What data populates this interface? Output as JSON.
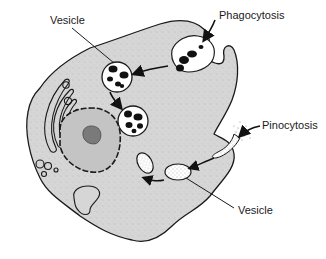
{
  "diagram": {
    "labels": {
      "vesicle_top": "Vesicle",
      "phagocytosis": "Phagocytosis",
      "pinocytosis": "Pinocytosis",
      "vesicle_bottom": "Vesicle"
    },
    "structures": [
      "cell-membrane",
      "cytoplasm",
      "nucleus",
      "nucleolus",
      "golgi-apparatus",
      "phagocytic-vesicles",
      "pinocytic-vesicles",
      "vacuole"
    ],
    "colors": {
      "cytoplasm": "#d6d6d6",
      "outline": "#1a1a1a",
      "vesicle_fill": "#ffffff",
      "particle": "#111111",
      "nucleolus": "#7a7a7a",
      "nucleus_fill": "#c4c4c4"
    }
  }
}
